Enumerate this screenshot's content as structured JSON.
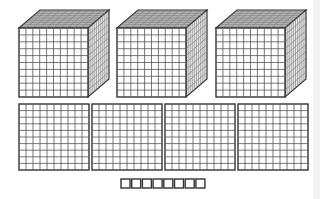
{
  "diagram": {
    "representation": {
      "thousands": 3,
      "hundreds": 4,
      "tens": 0,
      "ones": 8,
      "value": 3408
    },
    "colors": {
      "line": "#333333",
      "grid_front": "#555555",
      "grid_side": "#777777",
      "top_fill": "#bdbdbd",
      "side_fill": "#e8e8e8",
      "face_fill": "#ffffff",
      "edge_band": "#f3f3f3"
    },
    "thousand_cubes": [
      {
        "x": 19,
        "y": 28,
        "size": 69,
        "depth_dx": 21,
        "depth_dy": -18
      },
      {
        "x": 117,
        "y": 28,
        "size": 69,
        "depth_dx": 21,
        "depth_dy": -18
      },
      {
        "x": 216,
        "y": 28,
        "size": 69,
        "depth_dx": 21,
        "depth_dy": -18
      }
    ],
    "hundred_flats": [
      {
        "x": 19,
        "y": 104,
        "w": 70,
        "h": 66
      },
      {
        "x": 92,
        "y": 104,
        "w": 70,
        "h": 66
      },
      {
        "x": 165,
        "y": 104,
        "w": 70,
        "h": 66
      },
      {
        "x": 238,
        "y": 104,
        "w": 70,
        "h": 66
      }
    ],
    "unit_cubes": {
      "count": 8,
      "x": 121,
      "y": 179,
      "size": 9,
      "gap": 1.7
    },
    "grid_divisions": 10
  }
}
